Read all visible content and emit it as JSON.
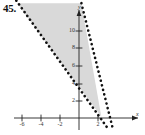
{
  "problem": {
    "number": "45."
  },
  "axes": {
    "x_name": "x",
    "y_name": "y",
    "x_tick_labels": [
      "-6",
      "-4",
      "-2",
      "2"
    ],
    "y_tick_labels": [
      "10",
      "8",
      "6",
      "4",
      "2"
    ]
  },
  "colors": {
    "shade_fill": "#d9d9d9",
    "line": "#111111",
    "axis": "#222222",
    "text": "#111111"
  },
  "chart_data": {
    "type": "line",
    "title": "45.",
    "xlabel": "x",
    "ylabel": "y",
    "xlim": [
      -7.0,
      6.5
    ],
    "ylim": [
      -1.6,
      13.2
    ],
    "grid": false,
    "legend": null,
    "xticks": [
      -6,
      -4,
      -2,
      2
    ],
    "yticks": [
      2,
      4,
      6,
      8,
      10
    ],
    "series": [
      {
        "name": "boundary-line-1",
        "style": "dashed",
        "slope": -1.4,
        "intercept": 4.3,
        "points": [
          [
            -6.6,
            13.5
          ],
          [
            2.3,
            0.0
          ],
          [
            3.1,
            -1.3
          ]
        ]
      },
      {
        "name": "boundary-line-2",
        "style": "dashed",
        "slope": -3.7,
        "intercept": 13.2,
        "points": [
          [
            0.25,
            13.2
          ],
          [
            3.2,
            0.0
          ],
          [
            3.6,
            -1.4
          ]
        ]
      }
    ],
    "shaded_region": {
      "name": "solution-region",
      "fill": "#d9d9d9",
      "vertices": [
        [
          -6.5,
          13.2
        ],
        [
          0.25,
          13.2
        ],
        [
          2.35,
          0.15
        ]
      ],
      "description": "Region between the two dashed boundary lines above their intersection."
    }
  }
}
